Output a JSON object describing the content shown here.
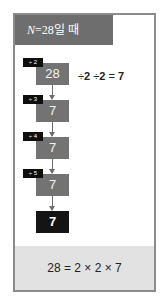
{
  "header": {
    "var": "N",
    "rest": "=28일 때"
  },
  "steps": [
    {
      "tag": "÷ 2",
      "value": "28"
    },
    {
      "tag": "÷ 3",
      "value": "7"
    },
    {
      "tag": "÷ 4",
      "value": "7"
    },
    {
      "tag": "÷ 5",
      "value": "7"
    }
  ],
  "final": {
    "value": "7"
  },
  "equation": {
    "part1": "÷",
    "num1": "2",
    "part2": "÷",
    "num2": "2",
    "eq": "=",
    "result": "7"
  },
  "footer": {
    "text": "28 = 2 × 2 × 7"
  },
  "colors": {
    "header_bg": "#6e6e6e",
    "box_bg": "#737373",
    "final_bg": "#141414",
    "tag_bg": "#0e0e0e",
    "footer_bg": "#e2e2e2",
    "border": "#8c8c8c"
  }
}
